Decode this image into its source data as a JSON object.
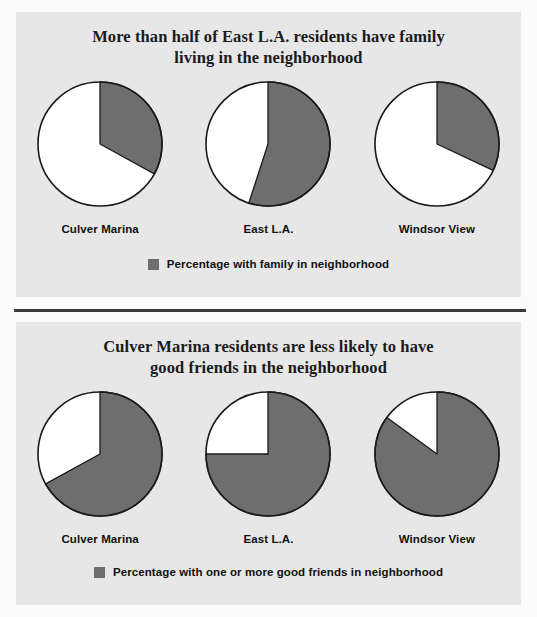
{
  "figure": {
    "background": "#fbfbfb",
    "panel_background": "#e7e7e7",
    "slice_color": "#6e6e6e",
    "remainder_color": "#ffffff",
    "outline_color": "#1a1a1a"
  },
  "panels": [
    {
      "id": "family",
      "title_line1": "More than half of East L.A. residents have family",
      "title_line2": "living in the neighborhood",
      "legend_label": "Percentage with family in neighborhood",
      "categories": [
        "Culver Marina",
        "East L.A.",
        "Windsor View"
      ],
      "values": [
        33,
        55,
        32
      ]
    },
    {
      "id": "friends",
      "title_line1": "Culver Marina residents are less likely to have",
      "title_line2": "good friends in the neighborhood",
      "legend_label": "Percentage with one or more good friends in neighborhood",
      "categories": [
        "Culver Marina",
        "East L.A.",
        "Windsor View"
      ],
      "values": [
        67,
        75,
        85
      ]
    }
  ],
  "chart_data": [
    {
      "type": "pie",
      "title": "More than half of East L.A. residents have family living in the neighborhood",
      "subtitle": "",
      "xlabel": "",
      "ylabel": "",
      "legend": [
        "Percentage with family in neighborhood"
      ],
      "legend_position": "bottom-center",
      "grid": false,
      "units": "percent",
      "start_angle_deg": 0,
      "direction": "clockwise",
      "categories": [
        "Culver Marina",
        "East L.A.",
        "Windsor View"
      ],
      "pies": [
        {
          "label": "Culver Marina",
          "slices": [
            {
              "name": "Percentage with family in neighborhood",
              "value": 33,
              "color": "#6e6e6e"
            },
            {
              "name": "Remainder",
              "value": 67,
              "color": "#ffffff"
            }
          ]
        },
        {
          "label": "East L.A.",
          "slices": [
            {
              "name": "Percentage with family in neighborhood",
              "value": 55,
              "color": "#6e6e6e"
            },
            {
              "name": "Remainder",
              "value": 45,
              "color": "#ffffff"
            }
          ]
        },
        {
          "label": "Windsor View",
          "slices": [
            {
              "name": "Percentage with family in neighborhood",
              "value": 32,
              "color": "#6e6e6e"
            },
            {
              "name": "Remainder",
              "value": 68,
              "color": "#ffffff"
            }
          ]
        }
      ]
    },
    {
      "type": "pie",
      "title": "Culver Marina residents are less likely to have good friends in the neighborhood",
      "subtitle": "",
      "xlabel": "",
      "ylabel": "",
      "legend": [
        "Percentage with one or more good friends in neighborhood"
      ],
      "legend_position": "bottom-center",
      "grid": false,
      "units": "percent",
      "start_angle_deg": 0,
      "direction": "clockwise",
      "categories": [
        "Culver Marina",
        "East L.A.",
        "Windsor View"
      ],
      "pies": [
        {
          "label": "Culver Marina",
          "slices": [
            {
              "name": "Percentage with one or more good friends in neighborhood",
              "value": 67,
              "color": "#6e6e6e"
            },
            {
              "name": "Remainder",
              "value": 33,
              "color": "#ffffff"
            }
          ]
        },
        {
          "label": "East L.A.",
          "slices": [
            {
              "name": "Percentage with one or more good friends in neighborhood",
              "value": 75,
              "color": "#6e6e6e"
            },
            {
              "name": "Remainder",
              "value": 25,
              "color": "#ffffff"
            }
          ]
        },
        {
          "label": "Windsor View",
          "slices": [
            {
              "name": "Percentage with one or more good friends in neighborhood",
              "value": 85,
              "color": "#6e6e6e"
            },
            {
              "name": "Remainder",
              "value": 15,
              "color": "#ffffff"
            }
          ]
        }
      ]
    }
  ]
}
